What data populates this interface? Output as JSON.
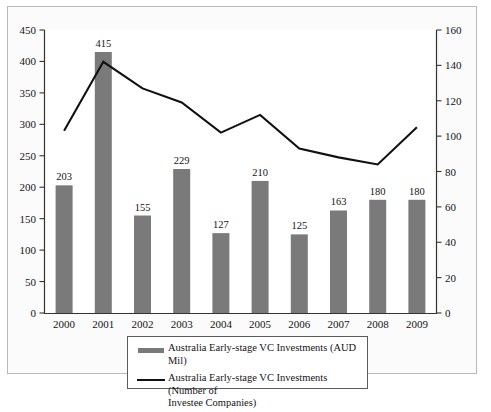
{
  "chart_data": {
    "type": "bar",
    "title": "",
    "subtitle": "",
    "xlabel": "",
    "ylabel": "",
    "y2label": "",
    "grid": false,
    "legend_position": "bottom",
    "categories": [
      "2000",
      "2001",
      "2002",
      "2003",
      "2004",
      "2005",
      "2006",
      "2007",
      "2008",
      "2009"
    ],
    "ylim": [
      0,
      450
    ],
    "y_ticks": [
      0,
      50,
      100,
      150,
      200,
      250,
      300,
      350,
      400,
      450
    ],
    "y2lim": [
      0,
      160
    ],
    "y2_ticks": [
      0,
      20,
      40,
      60,
      80,
      100,
      120,
      140,
      160
    ],
    "series": [
      {
        "name": "Australia Early-stage VC Investments (AUD Mil)",
        "type": "bar",
        "axis": "left",
        "color": "#7a7a7a",
        "values": [
          203,
          415,
          155,
          229,
          127,
          210,
          125,
          163,
          180,
          180
        ],
        "data_labels": [
          "203",
          "415",
          "155",
          "229",
          "127",
          "210",
          "125",
          "163",
          "180",
          "180"
        ]
      },
      {
        "name": "Australia Early-stage VC Investments (Number of Investee Companies)",
        "type": "line",
        "axis": "right",
        "color": "#111111",
        "values": [
          103,
          142,
          127,
          119,
          102,
          112,
          93,
          88,
          84,
          105
        ]
      }
    ]
  },
  "legend": {
    "entries": [
      {
        "swatch": "bar-swatch",
        "label": "Australia Early-stage VC Investments (AUD Mil)"
      },
      {
        "swatch": "line-swatch",
        "label": "Australia Early-stage VC Investments (Number of\nInvestee Companies)"
      }
    ]
  },
  "axes": {
    "left_ticks": [
      "450",
      "400",
      "350",
      "300",
      "250",
      "200",
      "150",
      "100",
      "50",
      "0"
    ],
    "right_ticks": [
      "160",
      "140",
      "120",
      "100",
      "80",
      "60",
      "40",
      "20",
      "0"
    ],
    "category_ticks": [
      "2000",
      "2001",
      "2002",
      "2003",
      "2004",
      "2005",
      "2006",
      "2007",
      "2008",
      "2009"
    ]
  }
}
